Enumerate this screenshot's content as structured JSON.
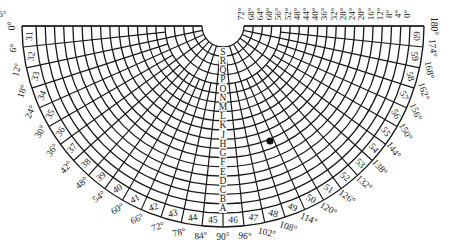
{
  "diagram": {
    "type": "polar-semicircle-grid",
    "colors": {
      "line": "#1a1a1a",
      "background": "#ffffff",
      "dot": "#111111"
    },
    "angle_labels": [
      "0°",
      "6°",
      "12°",
      "18°",
      "24°",
      "30°",
      "36°",
      "42°",
      "48°",
      "54°",
      "60°",
      "66°",
      "72°",
      "78°",
      "84°",
      "90°",
      "96°",
      "102°",
      "108°",
      "114°",
      "120°",
      "126°",
      "132°",
      "138°",
      "144°",
      "150°",
      "156°",
      "162°",
      "168°",
      "174°",
      "180°"
    ],
    "sector_numbers": [
      "31",
      "32",
      "33",
      "34",
      "35",
      "36",
      "37",
      "38",
      "39",
      "40",
      "41",
      "42",
      "43",
      "44",
      "45",
      "46",
      "47",
      "48",
      "49",
      "50",
      "51",
      "52",
      "53",
      "54",
      "55",
      "56",
      "57",
      "58",
      "59",
      "60"
    ],
    "ring_letters": [
      "A",
      "B",
      "C",
      "D",
      "E",
      "F",
      "G",
      "H",
      "J",
      "K",
      "L",
      "M",
      "N",
      "O",
      "P",
      "Q",
      "R",
      "S"
    ],
    "radial_labels": [
      "0°",
      "4°",
      "8°",
      "12°",
      "16°",
      "20°",
      "24°",
      "28°",
      "32°",
      "36°",
      "40°",
      "44°",
      "48°",
      "52°",
      "56°",
      "60°",
      "64°",
      "68°",
      "72°",
      "76°"
    ],
    "marker": {
      "label": "dot",
      "angle_deg": 115,
      "ring_fraction": 0.45
    }
  }
}
